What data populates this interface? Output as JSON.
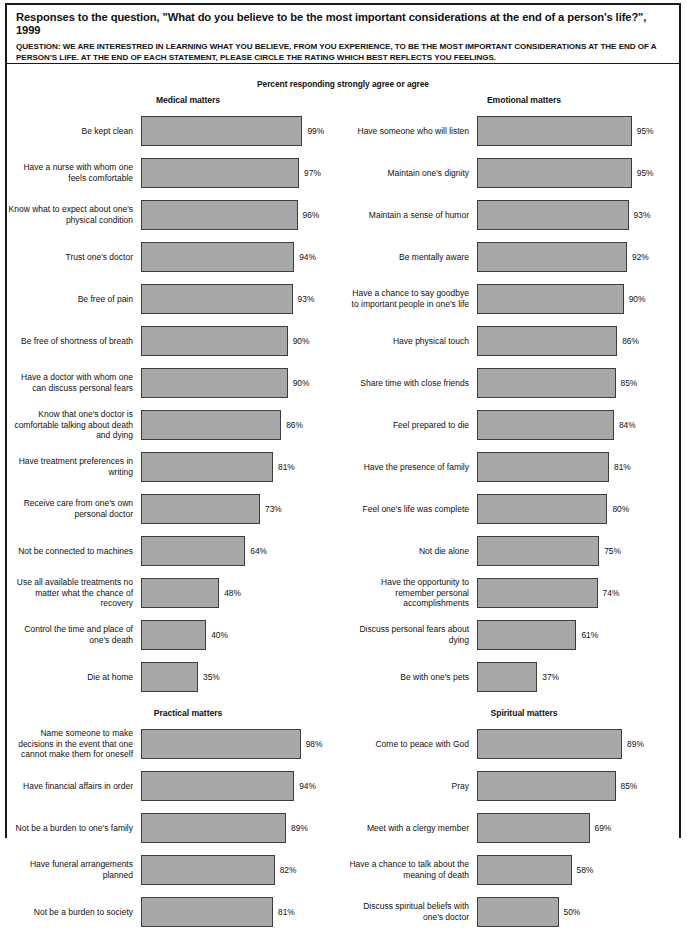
{
  "header": {
    "title": "Responses to the question, \"What do you believe to be the most important considerations at the end of a person's life?\", 1999",
    "question": "QUESTION: WE ARE INTERESTRED IN LEARNING WHAT YOU BELIEVE, FROM YOU EXPERIENCE, TO BE THE MOST IMPORTANT CONSIDERATIONS AT THE END OF A PERSON'S LIFE. AT THE END OF EACH STATEMENT, PLEASE CIRCLE THE RATING WHICH BEST REFLECTS YOU FEELINGS."
  },
  "subtitle": "Percent responding strongly agree or agree",
  "style": {
    "bar_fill": "#a8a8a8",
    "bar_border": "#3d3d3d",
    "frame": "#1a1a1a",
    "text": "#111111"
  },
  "chart_data": {
    "type": "bar",
    "title": "Responses to the question, \"What do you believe to be the most important considerations at the end of a person's life?\", 1999",
    "subtitle": "Percent responding strongly agree or agree",
    "xlabel": "Percent responding strongly agree or agree",
    "ylabel": "",
    "xlim": [
      0,
      100
    ],
    "unit": "%",
    "orientation": "horizontal",
    "grid": false,
    "legend": false,
    "panels": [
      {
        "title": "Medical matters",
        "categories": [
          "Be kept clean",
          "Have a nurse with whom one feels comfortable",
          "Know what to expect about one's physical condition",
          "Trust one's doctor",
          "Be free of pain",
          "Be free of shortness of breath",
          "Have a doctor with whom one can discuss personal fears",
          "Know that one's doctor is comfortable talking about death and dying",
          "Have treatment preferences in writing",
          "Receive care from one's own personal doctor",
          "Not be connected to machines",
          "Use all available treatments no matter what the chance of recovery",
          "Control the time and place of one's death",
          "Die at home"
        ],
        "values": [
          99,
          97,
          96,
          94,
          93,
          90,
          90,
          86,
          81,
          73,
          64,
          48,
          40,
          35
        ]
      },
      {
        "title": "Emotional matters",
        "categories": [
          "Have someone who will listen",
          "Maintain one's dignity",
          "Maintain a sense of humor",
          "Be mentally aware",
          "Have a chance to say goodbye to important people in one's life",
          "Have physical touch",
          "Share time with close friends",
          "Feel prepared to die",
          "Have the presence of family",
          "Feel one's life was complete",
          "Not die alone",
          "Have the opportunity to remember personal accomplishments",
          "Discuss personal fears about dying",
          "Be with one's pets"
        ],
        "values": [
          95,
          95,
          93,
          92,
          90,
          86,
          85,
          84,
          81,
          80,
          75,
          74,
          61,
          37
        ]
      },
      {
        "title": "Practical matters",
        "categories": [
          "Name someone to make decisions in the event that one cannot make them for oneself",
          "Have financial affairs in order",
          "Not be a burden to one's family",
          "Have funeral arrangements planned",
          "Not be a burden to society"
        ],
        "values": [
          98,
          94,
          89,
          82,
          81
        ]
      },
      {
        "title": "Spiritual matters",
        "categories": [
          "Come to peace with God",
          "Pray",
          "Meet with a clergy member",
          "Have a chance to talk about the meaning of death",
          "Discuss spiritual beliefs with one's doctor"
        ],
        "values": [
          89,
          85,
          69,
          58,
          50
        ]
      }
    ]
  }
}
